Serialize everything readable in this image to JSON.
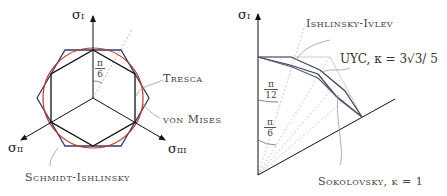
{
  "left_figure": {
    "axes": [
      {
        "label": "σ",
        "subscript": "I"
      },
      {
        "label": "σ",
        "subscript": "II"
      },
      {
        "label": "σ",
        "subscript": "III"
      }
    ],
    "angle_label": {
      "numerator": "π",
      "denominator": "6"
    },
    "curve_labels": {
      "tresca": "Tresca",
      "von_mises": "von Mises",
      "schmidt_ishlinsky": "Schmidt-Ishlinsky"
    },
    "colors": {
      "tresca": "#000000",
      "von_mises": "#c0392b",
      "schmidt_ishlinsky": "#2c3e6b"
    }
  },
  "right_figure": {
    "axis": {
      "label": "σ",
      "subscript": "I"
    },
    "angle_labels": [
      {
        "numerator": "π",
        "denominator": "12"
      },
      {
        "numerator": "π",
        "denominator": "6"
      }
    ],
    "curve_labels": {
      "ishlinsky_ivlev": "Ishlinsky-Ivlev",
      "uyc": "UYC, κ = 3√3/ 5",
      "sokolovsky": "Sokolovsky, κ = 1"
    }
  }
}
